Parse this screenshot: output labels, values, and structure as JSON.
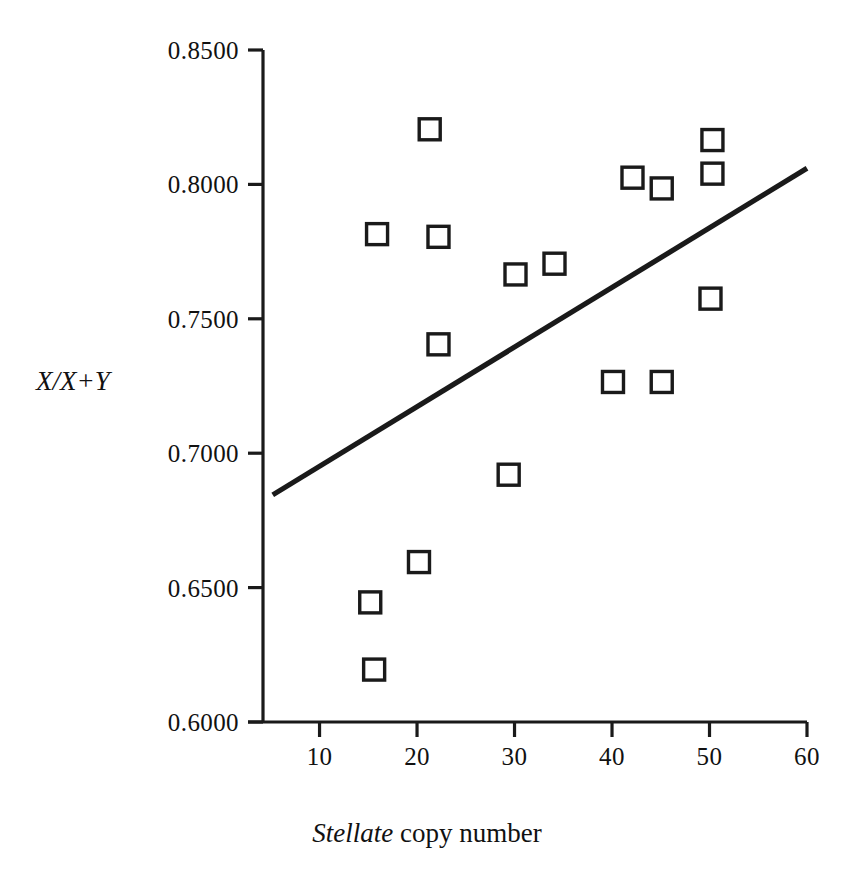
{
  "chart_data": {
    "type": "scatter",
    "title": "",
    "xlabel": "Stellate copy number",
    "xlabel_italic_part": "Stellate",
    "xlabel_roman_part": "copy number",
    "ylabel": "X/X+Y",
    "xlim": [
      4.2,
      60
    ],
    "ylim": [
      0.6,
      0.85
    ],
    "grid": false,
    "legend": null,
    "marker_style": "open-square",
    "marker_color": "#1a1a1a",
    "line_color": "#1a1a1a",
    "background_color": "#ffffff",
    "xticks": [
      10,
      20,
      30,
      40,
      50,
      60
    ],
    "xtick_labels": [
      "10",
      "20",
      "30",
      "40",
      "50",
      "60"
    ],
    "yticks": [
      0.6,
      0.65,
      0.7,
      0.75,
      0.8,
      0.85
    ],
    "ytick_labels": [
      "0.6000",
      "0.6500",
      "0.7000",
      "0.7500",
      "0.8000",
      "0.8500"
    ],
    "points": [
      {
        "x": 21.3,
        "y": 0.8205
      },
      {
        "x": 50.3,
        "y": 0.8165
      },
      {
        "x": 50.3,
        "y": 0.804
      },
      {
        "x": 42.1,
        "y": 0.8025
      },
      {
        "x": 45.1,
        "y": 0.7985
      },
      {
        "x": 15.9,
        "y": 0.7815
      },
      {
        "x": 22.2,
        "y": 0.7805
      },
      {
        "x": 34.1,
        "y": 0.7705
      },
      {
        "x": 30.1,
        "y": 0.7665
      },
      {
        "x": 50.1,
        "y": 0.7575
      },
      {
        "x": 22.2,
        "y": 0.7405
      },
      {
        "x": 40.1,
        "y": 0.7265
      },
      {
        "x": 45.1,
        "y": 0.7265
      },
      {
        "x": 29.4,
        "y": 0.692
      },
      {
        "x": 20.2,
        "y": 0.6595
      },
      {
        "x": 15.2,
        "y": 0.6445
      },
      {
        "x": 15.6,
        "y": 0.6195
      }
    ],
    "trendline": {
      "type": "linear-fit",
      "x_start": 5.2,
      "y_start": 0.6845,
      "x_end": 60.0,
      "y_end": 0.806
    }
  }
}
